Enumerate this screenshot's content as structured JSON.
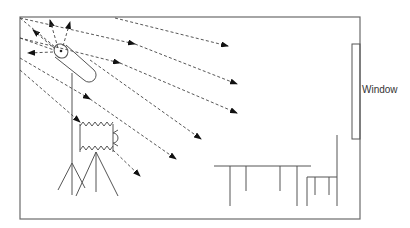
{
  "diagram": {
    "type": "photography-studio-lighting-setup",
    "labels": {
      "window": "Window"
    },
    "elements": [
      "room-outline",
      "window",
      "studio-light",
      "light-stand",
      "light-rays",
      "camera",
      "camera-tripod",
      "table",
      "chair"
    ],
    "colors": {
      "stroke": "#555555",
      "arrow": "#111111",
      "background": "#ffffff"
    }
  }
}
